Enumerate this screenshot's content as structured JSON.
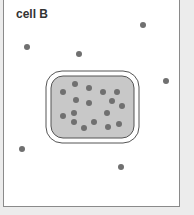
{
  "diagram": {
    "label": "cell B",
    "colors": {
      "background": "#ececec",
      "panel": "#ffffff",
      "panel_border": "#8a8a8a",
      "cell_fill": "#c8c8c8",
      "membrane": "#555555",
      "particle": "#707070"
    },
    "cell": {
      "outer": {
        "x": 46,
        "y": 71,
        "w": 93,
        "h": 72,
        "r": 16
      },
      "inner": {
        "x": 51,
        "y": 76,
        "w": 83,
        "h": 62,
        "r": 12
      }
    },
    "particles_inside": [
      [
        75,
        84
      ],
      [
        89,
        88
      ],
      [
        63,
        92
      ],
      [
        103,
        92
      ],
      [
        117,
        92
      ],
      [
        76,
        100
      ],
      [
        89,
        103
      ],
      [
        112,
        101
      ],
      [
        122,
        106
      ],
      [
        63,
        116
      ],
      [
        74,
        113
      ],
      [
        107,
        113
      ],
      [
        74,
        122
      ],
      [
        84,
        128
      ],
      [
        94,
        122
      ],
      [
        108,
        127
      ],
      [
        119,
        124
      ]
    ],
    "particles_outside": [
      [
        143,
        25
      ],
      [
        27,
        47
      ],
      [
        79,
        54
      ],
      [
        166,
        81
      ],
      [
        22,
        149
      ],
      [
        121,
        167
      ]
    ]
  }
}
